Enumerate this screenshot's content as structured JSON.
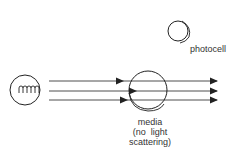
{
  "diagram": {
    "type": "light-transmission-schematic",
    "colors": {
      "stroke": "#222222",
      "text": "#333333",
      "background": "#ffffff"
    },
    "components": {
      "lamp": {
        "icon": "lamp-filament-icon"
      },
      "media": {
        "icon": "media-circle-icon"
      },
      "photocell": {
        "icon": "photocell-icon"
      }
    },
    "labels": {
      "photocell": "photocell",
      "media_line1": "media",
      "media_line2": "(no  light",
      "media_line3": "scattering)"
    },
    "rays": [
      {
        "name": "top-ray"
      },
      {
        "name": "middle-ray"
      },
      {
        "name": "bottom-ray"
      }
    ]
  }
}
